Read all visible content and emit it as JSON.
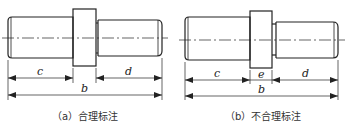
{
  "panels": [
    {
      "id": "a",
      "caption": "（a）合理标注",
      "dimensions": {
        "c": "c",
        "b": "b",
        "d": "d"
      }
    },
    {
      "id": "b",
      "caption": "（b）不合理标注",
      "dimensions": {
        "c": "c",
        "e": "e",
        "b": "b",
        "d": "d"
      }
    }
  ],
  "colors": {
    "line": "#222222",
    "background": "#ffffff"
  }
}
